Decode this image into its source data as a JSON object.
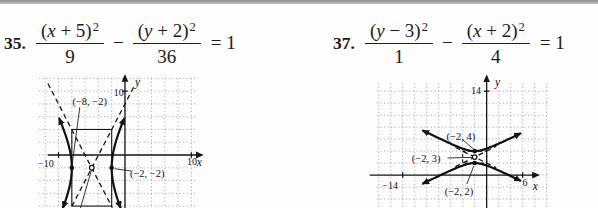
{
  "problems": [
    {
      "number": "35.",
      "equation": {
        "frac1": {
          "pre": "(",
          "variable": "x",
          "post": " + 5)",
          "exp": "2",
          "den": "9"
        },
        "operator": "−",
        "frac2": {
          "pre": "(",
          "variable": "y",
          "post": " + 2)",
          "exp": "2",
          "den": "36"
        },
        "rhs": "= 1"
      }
    },
    {
      "number": "37.",
      "equation": {
        "frac1": {
          "pre": "(",
          "variable": "y",
          "post": " − 3)",
          "exp": "2",
          "den": "1"
        },
        "operator": "−",
        "frac2": {
          "pre": "(",
          "variable": "x",
          "post": " + 2)",
          "exp": "2",
          "den": "4"
        },
        "rhs": "= 1"
      }
    }
  ],
  "chart_data": [
    {
      "type": "line",
      "subtype": "hyperbola",
      "exercise": "35",
      "equation": "(x + 5)²/9 − (y + 2)²/36 = 1",
      "center": [
        -5,
        -2
      ],
      "a": 3,
      "b": 6,
      "opens": "horizontal",
      "vertices": [
        [
          -8,
          -2
        ],
        [
          -2,
          -2
        ]
      ],
      "asymptote_slopes": [
        2,
        -2
      ],
      "window": {
        "xmin": -15.5,
        "xmax": 12.2,
        "ymin": -8.3,
        "ymax": 13.0
      },
      "grid": {
        "step": 2,
        "x_range": [
          -12.9,
          10.9
        ],
        "y_range": [
          -8.3,
          12.0
        ]
      },
      "axes": {
        "x_range": [
          -11.6,
          11.6
        ],
        "y_range": [
          -8.3,
          12.4
        ]
      },
      "ticks": {
        "x": [
          -10,
          10
        ],
        "y": [
          10
        ]
      },
      "tick_labels": [
        {
          "text": "−10",
          "at": [
            -11.9,
            -1.4
          ],
          "anchor": "middle"
        },
        {
          "text": "10",
          "at": [
            10.1,
            -1.1
          ],
          "anchor": "middle"
        },
        {
          "text": "10",
          "at": [
            -0.2,
            9.7
          ],
          "anchor": "end"
        },
        {
          "text": "x",
          "at": [
            11.2,
            -1.2
          ],
          "anchor": "middle",
          "italic": true
        },
        {
          "text": "y",
          "at": [
            1.5,
            11.3
          ],
          "anchor": "start",
          "italic": true
        }
      ],
      "box": {
        "x": [
          -8,
          -2
        ],
        "y": [
          -8,
          4
        ],
        "dashed": false
      },
      "asymptote_segments": [
        [
          [
            -11.6,
            11.2
          ],
          [
            -1.9,
            -8.25
          ]
        ],
        [
          [
            1.3,
            10.6
          ],
          [
            -8.1,
            -8.25
          ]
        ]
      ],
      "branch_extent": [
        5.7,
        -8.2
      ],
      "points": [
        {
          "xy": [
            -8,
            -2
          ],
          "style": "filled"
        },
        {
          "xy": [
            -2,
            -2
          ],
          "style": "filled"
        },
        {
          "xy": [
            -5,
            -2
          ],
          "style": "open"
        }
      ],
      "point_labels": [
        {
          "text": "(−8, −2)",
          "at": [
            -5.3,
            8.3
          ],
          "anchor": "middle"
        },
        {
          "text": "(−2, −2)",
          "at": [
            0.75,
            -2.9
          ],
          "anchor": "start"
        }
      ],
      "leaders": [
        {
          "from": [
            -6.8,
            7.5
          ],
          "to": [
            -7.95,
            -1.5
          ]
        },
        {
          "from": [
            0.9,
            -2.5
          ],
          "to": [
            -1.55,
            -2.15
          ]
        },
        {
          "from": [
            -5.05,
            -2.4
          ],
          "to": [
            -6.7,
            -8.3
          ]
        }
      ]
    },
    {
      "type": "line",
      "subtype": "hyperbola",
      "exercise": "37",
      "equation": "(y − 3)²/1 − (x + 2)²/4 = 1",
      "center": [
        -2,
        3
      ],
      "a": 1,
      "b": 2,
      "opens": "vertical",
      "vertices": [
        [
          -2,
          4
        ],
        [
          -2,
          2
        ]
      ],
      "asymptote_slopes": [
        0.5,
        -0.5
      ],
      "window": {
        "xmin": -21.95,
        "xmax": 14.4,
        "ymin": -5.5,
        "ymax": 16.7
      },
      "grid": {
        "step": 2,
        "x_range": [
          -18.3,
          10.1
        ],
        "y_range": [
          -5.4,
          15.3
        ]
      },
      "axes": {
        "x_range": [
          -19.5,
          8.6
        ],
        "y_range": [
          -5.5,
          16.5
        ]
      },
      "ticks": {
        "x": [
          -14,
          6
        ],
        "y": [
          14
        ]
      },
      "tick_labels": [
        {
          "text": "14",
          "at": [
            -0.95,
            14.0
          ],
          "anchor": "end"
        },
        {
          "text": "−14",
          "at": [
            -16.1,
            -1.8
          ],
          "anchor": "middle"
        },
        {
          "text": "6",
          "at": [
            6.4,
            -1.4
          ],
          "anchor": "middle"
        },
        {
          "text": "x",
          "at": [
            8.1,
            -2.0
          ],
          "anchor": "middle",
          "italic": true
        },
        {
          "text": "y",
          "at": [
            1.4,
            15.3
          ],
          "anchor": "start",
          "italic": true
        }
      ],
      "box": {
        "x": [
          -4,
          0
        ],
        "y": [
          2,
          4
        ],
        "dashed": true
      },
      "asymptote_segments": [
        [
          [
            -5.2,
            1.4
          ],
          [
            1.6,
            4.8
          ]
        ],
        [
          [
            -5.2,
            4.6
          ],
          [
            1.6,
            1.2
          ]
        ]
      ],
      "branch_extent": [
        -10.6,
        5.6
      ],
      "points": [
        {
          "xy": [
            -2,
            4
          ],
          "style": "filled"
        },
        {
          "xy": [
            -2,
            2
          ],
          "style": "filled"
        },
        {
          "xy": [
            -2,
            3
          ],
          "style": "open"
        }
      ],
      "point_labels": [
        {
          "text": "(−2, 4)",
          "at": [
            -4.3,
            6.4
          ],
          "anchor": "middle"
        },
        {
          "text": "(−2, 3)",
          "at": [
            -10.1,
            2.7
          ],
          "anchor": "middle"
        },
        {
          "text": "(−2, 2)",
          "at": [
            -4.6,
            -2.8
          ],
          "anchor": "middle"
        }
      ],
      "leaders": [
        {
          "from": [
            -4.0,
            5.9
          ],
          "to": [
            -2.15,
            4.3
          ]
        },
        {
          "from": [
            -6.5,
            2.85
          ],
          "to": [
            -2.5,
            2.95
          ]
        },
        {
          "from": [
            -3.3,
            -1.5
          ],
          "to": [
            -2.15,
            1.5
          ]
        }
      ]
    }
  ]
}
